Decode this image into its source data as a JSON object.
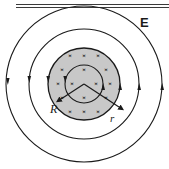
{
  "figure": {
    "type": "physics-field-diagram",
    "background_color": "#ffffff",
    "line_color": "#1a1a1a",
    "shaded_region_color": "#c8c8c8",
    "top_rule": {
      "name": "top-horizontal-rule",
      "y_positions": [
        4,
        7
      ],
      "x_start": 16,
      "x_end": 169,
      "thickness": 1
    },
    "center": {
      "x": 84,
      "y": 84
    },
    "labels": [
      {
        "id": "E",
        "text": "E",
        "meaning": "electric-field",
        "x": 140,
        "y": 16,
        "style": "bold-sans"
      },
      {
        "id": "R",
        "text": "R",
        "meaning": "radius-of-field-region",
        "x": 50,
        "y": 103,
        "style": "italic-serif"
      },
      {
        "id": "r",
        "text": "r",
        "meaning": "radial-distance",
        "x": 110,
        "y": 113,
        "style": "italic-serif"
      }
    ],
    "circles": [
      {
        "id": "field-line-outer",
        "name": "outer-field-line",
        "radius": 78,
        "fill": "none",
        "stroke_width": 1.1
      },
      {
        "id": "field-line-middle",
        "name": "middle-field-line",
        "radius": 55,
        "fill": "none",
        "stroke_width": 1.1
      },
      {
        "id": "magnetic-field-region",
        "name": "shaded-magnetic-field-region",
        "radius": 36,
        "fill": "#c8c8c8",
        "stroke_width": 1.3
      },
      {
        "id": "field-line-inner",
        "name": "inner-field-line",
        "radius": 19,
        "fill": "none",
        "stroke_width": 1.1
      }
    ],
    "field_direction": "counterclockwise",
    "magnetic_field_direction": "into-page",
    "cross_symbol": "×",
    "cross_marks": [
      {
        "x": 70,
        "y": 56
      },
      {
        "x": 84,
        "y": 56
      },
      {
        "x": 98,
        "y": 56
      },
      {
        "x": 62,
        "y": 70
      },
      {
        "x": 84,
        "y": 70
      },
      {
        "x": 106,
        "y": 70
      },
      {
        "x": 58,
        "y": 84
      },
      {
        "x": 72,
        "y": 84
      },
      {
        "x": 96,
        "y": 84
      },
      {
        "x": 110,
        "y": 84
      },
      {
        "x": 62,
        "y": 98
      },
      {
        "x": 84,
        "y": 98
      },
      {
        "x": 106,
        "y": 98
      },
      {
        "x": 70,
        "y": 112
      },
      {
        "x": 84,
        "y": 112
      },
      {
        "x": 98,
        "y": 112
      }
    ],
    "radius_arrows": [
      {
        "id": "arrow-R",
        "name": "radius-R-arrow",
        "from": {
          "x": 84,
          "y": 84
        },
        "to": {
          "x": 58,
          "y": 101
        },
        "label": "R"
      },
      {
        "id": "arrow-r",
        "name": "radius-r-arrow",
        "from": {
          "x": 84,
          "y": 84
        },
        "to": {
          "x": 122,
          "y": 109
        },
        "label": "r"
      }
    ],
    "direction_arrowheads": [
      {
        "id": "outer-left",
        "name": "outer-left-arrowhead",
        "x": 6,
        "y": 81,
        "rotation": 180
      },
      {
        "id": "outer-right",
        "name": "outer-right-arrowhead",
        "x": 162,
        "y": 87,
        "rotation": 0
      },
      {
        "id": "middle-left",
        "name": "middle-left-arrowhead",
        "x": 29,
        "y": 81,
        "rotation": 180
      },
      {
        "id": "middle-right",
        "name": "middle-right-arrowhead",
        "x": 139,
        "y": 87,
        "rotation": 0
      },
      {
        "id": "region-left",
        "name": "region-left-arrowhead",
        "x": 48,
        "y": 81,
        "rotation": 180
      },
      {
        "id": "region-right",
        "name": "region-right-arrowhead",
        "x": 120,
        "y": 87,
        "rotation": 0
      },
      {
        "id": "inner-left",
        "name": "inner-left-arrowhead",
        "x": 65,
        "y": 81,
        "rotation": 180
      },
      {
        "id": "inner-right",
        "name": "inner-right-arrowhead",
        "x": 103,
        "y": 87,
        "rotation": 0
      }
    ]
  }
}
